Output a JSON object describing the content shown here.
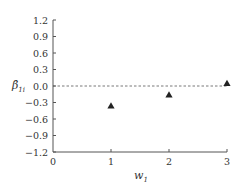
{
  "chart_data": {
    "type": "scatter",
    "title": "",
    "xlabel": "w1",
    "xlabel_main": "w",
    "xlabel_sub": "1",
    "ylabel": "β̂1i",
    "ylabel_main": "β̂",
    "ylabel_sub": "1i",
    "xlim": [
      0,
      3
    ],
    "ylim": [
      -1.2,
      1.2
    ],
    "x_ticks": [
      0,
      1,
      2,
      3
    ],
    "x_tick_labels": [
      "0",
      "1",
      "2",
      "3"
    ],
    "y_ticks": [
      1.2,
      0.9,
      0.6,
      0.3,
      0.0,
      -0.3,
      -0.6,
      -0.9,
      -1.2
    ],
    "y_tick_labels": [
      "1.2",
      "0.9",
      "0.6",
      "0.3",
      "0.0",
      "−0.3",
      "−0.6",
      "−0.9",
      "−1.2"
    ],
    "grid": false,
    "reference_line": {
      "y": 0.0,
      "style": "dashed"
    },
    "marker": "triangle",
    "series": [
      {
        "name": "β̂1i",
        "x": [
          1,
          2,
          3
        ],
        "y": [
          -0.36,
          -0.16,
          0.05
        ]
      }
    ],
    "colors": {
      "axis": "#555555",
      "marker": "#222222",
      "text": "#333333",
      "reference": "#555555"
    }
  }
}
